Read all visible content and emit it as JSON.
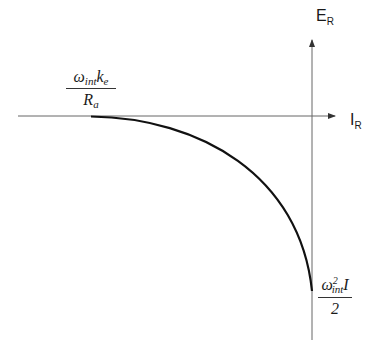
{
  "diagram": {
    "axes": {
      "x_label": "I",
      "x_label_sub": "R",
      "y_label": "E",
      "y_label_sub": "R"
    },
    "labels": {
      "intercept_x": {
        "num_main": "ω",
        "num_sub": "int",
        "num_main2": "k",
        "num_sub2": "e",
        "den_main": "R",
        "den_sub": "a"
      },
      "intercept_y": {
        "num_main": "ω",
        "num_sup": "2",
        "num_sub": "int",
        "num_main2": "I",
        "den_main": "2"
      }
    },
    "colors": {
      "curve": "#111111",
      "axis": "#555555"
    }
  }
}
